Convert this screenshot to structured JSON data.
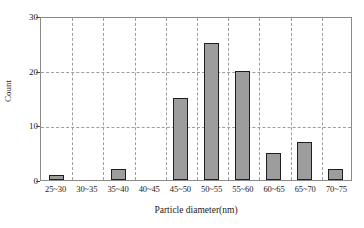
{
  "chart_data": {
    "type": "bar",
    "title": "",
    "xlabel": "Particle diameter(nm)",
    "ylabel": "Count",
    "categories": [
      "25~30",
      "30~35",
      "35~40",
      "40~45",
      "45~50",
      "50~55",
      "55~60",
      "60~65",
      "65~70",
      "70~75"
    ],
    "values": [
      1,
      0,
      2,
      0,
      15,
      25,
      20,
      5,
      7,
      2
    ],
    "ylim": [
      0,
      30
    ],
    "yticks": [
      0,
      10,
      20,
      30
    ],
    "ytick_labels": [
      "0",
      "10",
      "20",
      "30"
    ],
    "grid": "dashed gridlines, vertical between categories and horizontal at 10, 20, 30",
    "legend": "none",
    "colors": {
      "bar_fill": "#9d9d9d",
      "bar_edge": "#1f1f1f",
      "grid": "#9e9e9e",
      "frame": "#8a8a8a",
      "text": "#1a1a1a",
      "background": "#ffffff"
    }
  }
}
